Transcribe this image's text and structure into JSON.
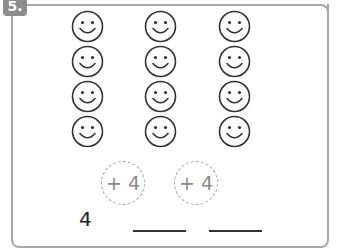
{
  "exercise": {
    "number": "5.",
    "smiley_grid": {
      "columns": 3,
      "rows": 4,
      "icon": "smiley-face-icon",
      "column_centers_x": [
        87,
        160,
        234
      ],
      "row_tops_y": [
        10,
        45,
        80,
        115
      ]
    },
    "step_circles": [
      {
        "label": "+ 4"
      },
      {
        "label": "+ 4"
      }
    ],
    "sequence": {
      "start_value": "4",
      "blanks": [
        "",
        ""
      ]
    }
  },
  "colors": {
    "border": "#a8a8a8",
    "badge": "#8c8c8c",
    "smiley_stroke": "#333333",
    "dashed_circle": "#a0a0a0"
  }
}
